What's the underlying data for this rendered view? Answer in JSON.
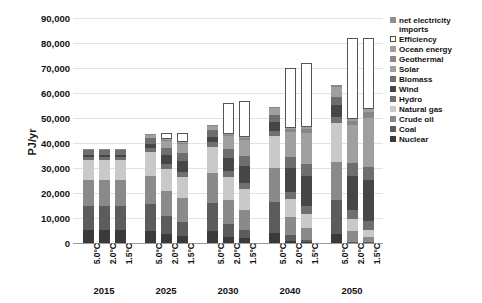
{
  "chart_data": {
    "type": "bar",
    "title": "",
    "xlabel": "",
    "ylabel": "PJ/yr",
    "ylim": [
      0,
      90000
    ],
    "ytick_step": 10000,
    "grid": true,
    "stacked": true,
    "legend_position": "right",
    "ytick_labels": [
      "90,000",
      "80,000",
      "70,000",
      "60,000",
      "50,000",
      "40,000",
      "30,000",
      "20,000",
      "10,000",
      "0"
    ],
    "ytick_values": [
      90000,
      80000,
      70000,
      60000,
      50000,
      40000,
      30000,
      20000,
      10000,
      0
    ],
    "year_groups": [
      "2015",
      "2025",
      "2030",
      "2040",
      "2050"
    ],
    "scenarios": [
      "5.0°C",
      "2.0°C",
      "1.5°C"
    ],
    "categories": [
      "2015 5.0°C",
      "2015 2.0°C",
      "2015 1.5°C",
      "2025 5.0°C",
      "2025 2.0°C",
      "2025 1.5°C",
      "2030 5.0°C",
      "2030 2.0°C",
      "2030 1.5°C",
      "2040 5.0°C",
      "2040 2.0°C",
      "2040 1.5°C",
      "2050 5.0°C",
      "2050 2.0°C",
      "2050 1.5°C"
    ],
    "series": [
      {
        "name": "Nuclear",
        "color": "#3a3a3a",
        "values": [
          5200,
          5200,
          5200,
          5000,
          3600,
          3000,
          4800,
          2600,
          1900,
          4200,
          900,
          500,
          3800,
          0,
          0
        ]
      },
      {
        "name": "Coal",
        "color": "#5c5c5c",
        "values": [
          9800,
          9800,
          9800,
          10600,
          7200,
          5600,
          11200,
          5200,
          3200,
          12400,
          2200,
          900,
          13600,
          600,
          300
        ]
      },
      {
        "name": "Crude oil",
        "color": "#8a8a8a",
        "values": [
          10200,
          10200,
          10200,
          11400,
          10200,
          9400,
          12000,
          9600,
          8200,
          13600,
          7200,
          4800,
          15200,
          4200,
          2200
        ]
      },
      {
        "name": "Natural gas",
        "color": "#c9c9c9",
        "values": [
          8000,
          8000,
          8000,
          9400,
          8800,
          8400,
          10400,
          9000,
          8200,
          12600,
          7400,
          5600,
          15400,
          5000,
          2600
        ]
      },
      {
        "name": "Hydro",
        "color": "#707070",
        "values": [
          1400,
          1400,
          1400,
          1700,
          2000,
          2100,
          1900,
          2300,
          2500,
          2200,
          2900,
          3100,
          2500,
          3400,
          3600
        ]
      },
      {
        "name": "Wind",
        "color": "#464646",
        "values": [
          600,
          600,
          600,
          1600,
          3400,
          4200,
          2200,
          5400,
          6800,
          3400,
          9600,
          11800,
          4600,
          13800,
          16400
        ]
      },
      {
        "name": "Biomass",
        "color": "#6e6e6e",
        "values": [
          2000,
          2000,
          2000,
          2400,
          3000,
          3200,
          2600,
          3600,
          3900,
          3000,
          4400,
          4800,
          3400,
          5000,
          5400
        ]
      },
      {
        "name": "Solar",
        "color": "#a0a0a0",
        "values": [
          300,
          300,
          300,
          1100,
          2800,
          3600,
          1600,
          5000,
          6400,
          2600,
          9800,
          12600,
          3800,
          15200,
          19600
        ]
      },
      {
        "name": "Geothermal",
        "color": "#878787",
        "values": [
          200,
          200,
          200,
          300,
          500,
          600,
          400,
          700,
          900,
          600,
          1200,
          1600,
          800,
          1800,
          2400
        ]
      },
      {
        "name": "Ocean energy",
        "color": "#9e9e9e",
        "values": [
          0,
          0,
          0,
          0,
          100,
          150,
          0,
          200,
          300,
          0,
          500,
          700,
          0,
          800,
          1100
        ]
      },
      {
        "name": "Efficiency",
        "color": "#ffffff",
        "outlined": true,
        "values": [
          0,
          0,
          0,
          0,
          2400,
          3700,
          0,
          12400,
          14700,
          0,
          23900,
          25800,
          0,
          32200,
          28400
        ]
      },
      {
        "name": "net electricity imports",
        "color": "#8f8f8f",
        "values": [
          0,
          0,
          0,
          0,
          0,
          0,
          0,
          0,
          0,
          0,
          0,
          0,
          0,
          0,
          0
        ]
      }
    ],
    "totals": [
      37700,
      37700,
      37700,
      43500,
      43600,
      43800,
      47100,
      56000,
      57000,
      54600,
      70000,
      72200,
      63100,
      82000,
      82000
    ]
  },
  "legend": {
    "items": [
      {
        "label": "net electricity imports",
        "color": "#8f8f8f",
        "outlined": false
      },
      {
        "label": "Efficiency",
        "color": "#ffffff",
        "outlined": true
      },
      {
        "label": "Ocean energy",
        "color": "#9e9e9e",
        "outlined": false
      },
      {
        "label": "Geothermal",
        "color": "#878787",
        "outlined": false
      },
      {
        "label": "Solar",
        "color": "#a0a0a0",
        "outlined": false
      },
      {
        "label": "Biomass",
        "color": "#6e6e6e",
        "outlined": false
      },
      {
        "label": "Wind",
        "color": "#464646",
        "outlined": false
      },
      {
        "label": "Hydro",
        "color": "#707070",
        "outlined": false
      },
      {
        "label": "Natural gas",
        "color": "#c9c9c9",
        "outlined": false
      },
      {
        "label": "Crude oil",
        "color": "#8a8a8a",
        "outlined": false
      },
      {
        "label": "Coal",
        "color": "#5c5c5c",
        "outlined": false
      },
      {
        "label": "Nuclear",
        "color": "#3a3a3a",
        "outlined": false
      }
    ]
  }
}
